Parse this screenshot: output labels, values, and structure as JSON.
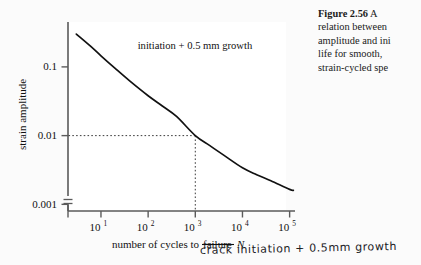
{
  "figure": {
    "caption_lines": [
      "Figure 2.56   A",
      "relation between",
      "amplitude and ini",
      "life for smooth,",
      "strain-cycled spe"
    ],
    "caption_label": "Figure 2.56",
    "handwritten_note": "crack initiation + 0.5mm growth"
  },
  "chart_data": {
    "type": "line",
    "title": "",
    "xlabel": "number of cycles to failure N",
    "xlabel_parts": {
      "prefix": "number of cycles to ",
      "struck": "failure",
      "suffix": " ",
      "symbol": "N"
    },
    "ylabel": "strain amplitude",
    "xscale": "log",
    "yscale": "log",
    "xlim": [
      2,
      130000
    ],
    "ylim": [
      0.0008,
      0.45
    ],
    "grid": false,
    "legend": false,
    "annotations": [
      {
        "text": "initiation + 0.5 mm growth",
        "x": 60,
        "y": 0.18
      }
    ],
    "xticks": [
      10,
      100,
      1000,
      10000,
      100000
    ],
    "xticklabels": [
      "10¹",
      "10²",
      "10³",
      "10⁴",
      "10⁵"
    ],
    "xtick_mantissa": "10",
    "xtick_exponents": [
      "1",
      "2",
      "3",
      "4",
      "5"
    ],
    "yticks": [
      0.1,
      0.01,
      0.001
    ],
    "yticklabels": [
      "0.1",
      "0.01",
      "0.001"
    ],
    "axis_break": {
      "axis": "y",
      "present": true,
      "note": "break symbol below 0.001 on vertical axis"
    },
    "guide_lines": {
      "style": "dotted",
      "x": 1000,
      "y": 0.01,
      "label": "guide at N = 10^3, strain amplitude = 0.01"
    },
    "series": [
      {
        "name": "initiation + 0.5 mm growth",
        "x": [
          3,
          6,
          10,
          20,
          40,
          100,
          200,
          400,
          1000,
          2000,
          4000,
          10000,
          20000,
          40000,
          100000,
          120000
        ],
        "y": [
          0.3,
          0.2,
          0.145,
          0.095,
          0.063,
          0.038,
          0.027,
          0.019,
          0.01,
          0.0072,
          0.0052,
          0.0034,
          0.0027,
          0.0022,
          0.00165,
          0.0016
        ]
      }
    ]
  },
  "colors": {
    "page_background": "#fbfbfb",
    "plot_background": "#ffffff",
    "axis": "#5a5a5a",
    "curve": "#111111",
    "text": "#111111",
    "handwriting": "#20201e"
  }
}
